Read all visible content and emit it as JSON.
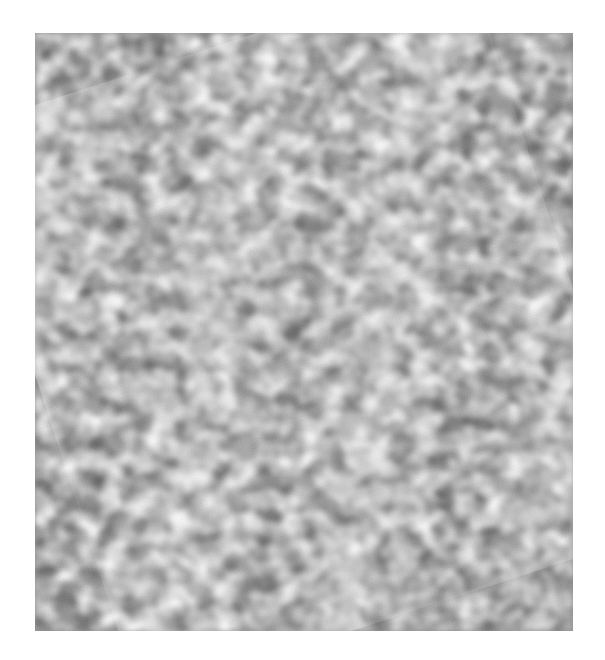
{
  "image": {
    "kind": "grayscale microscopy scan",
    "description": "Noisy grayscale surface texture with mottled bright and dark blobs and faint diagonal bright bands running from upper-right to lower-left",
    "palette": {
      "dark": "#6e6e6e",
      "mid": "#9a9a9a",
      "light": "#f4f4f4",
      "background": "#ffffff"
    },
    "bounds": {
      "x": 35,
      "y": 33,
      "width": 538,
      "height": 598
    }
  }
}
